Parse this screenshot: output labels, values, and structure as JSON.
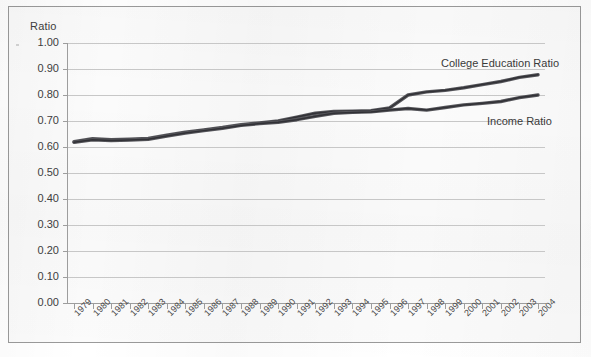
{
  "figure": {
    "y_axis_title": "Ratio"
  },
  "chart_data": {
    "type": "line",
    "title": "",
    "subtitle": "",
    "xlabel": "",
    "ylabel": "Ratio",
    "ylim": [
      0.0,
      1.0
    ],
    "xlim": [
      1979,
      2004
    ],
    "grid": true,
    "legend_position": "inline-annotation",
    "x": [
      1979,
      1980,
      1981,
      1982,
      1983,
      1984,
      1985,
      1986,
      1987,
      1988,
      1989,
      1990,
      1991,
      1992,
      1993,
      1994,
      1995,
      1996,
      1997,
      1998,
      1999,
      2000,
      2001,
      2002,
      2003,
      2004
    ],
    "categories": [
      "1979",
      "1980",
      "1981",
      "1982",
      "1983",
      "1984",
      "1985",
      "1986",
      "1987",
      "1988",
      "1989",
      "1990",
      "1991",
      "1992",
      "1993",
      "1994",
      "1995",
      "1996",
      "1997",
      "1998",
      "1999",
      "2000",
      "2001",
      "2002",
      "2003",
      "2004"
    ],
    "y_ticks": [
      "0.00",
      "0.10",
      "0.20",
      "0.30",
      "0.40",
      "0.50",
      "0.60",
      "0.70",
      "0.80",
      "0.90",
      "1.00"
    ],
    "y_tick_values": [
      0.0,
      0.1,
      0.2,
      0.3,
      0.4,
      0.5,
      0.6,
      0.7,
      0.8,
      0.9,
      1.0
    ],
    "series": [
      {
        "name": "College Education Ratio",
        "color": "#55555a",
        "annotation": "College Education Ratio",
        "values": [
          0.62,
          0.632,
          0.628,
          0.63,
          0.633,
          0.645,
          0.657,
          0.666,
          0.675,
          0.686,
          0.693,
          0.7,
          0.715,
          0.73,
          0.737,
          0.738,
          0.74,
          0.75,
          0.8,
          0.812,
          0.818,
          0.828,
          0.84,
          0.852,
          0.868,
          0.878
        ]
      },
      {
        "name": "Income Ratio",
        "color": "#55555a",
        "annotation": "Income Ratio",
        "values": [
          0.618,
          0.628,
          0.625,
          0.627,
          0.63,
          0.642,
          0.654,
          0.663,
          0.672,
          0.683,
          0.69,
          0.695,
          0.705,
          0.718,
          0.73,
          0.733,
          0.735,
          0.742,
          0.748,
          0.742,
          0.752,
          0.762,
          0.768,
          0.775,
          0.79,
          0.8
        ]
      }
    ]
  }
}
